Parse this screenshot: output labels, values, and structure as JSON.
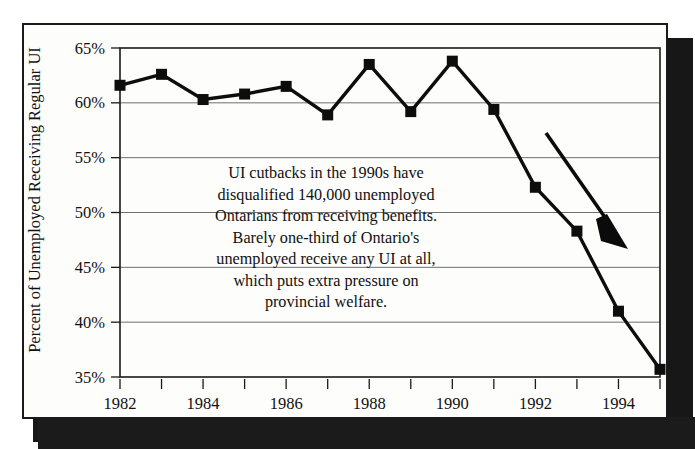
{
  "figure": {
    "cut_off_top_text": "",
    "y_axis_title": "Percent of Unemployed Receiving Regular UI",
    "annotation_lines": [
      "UI cutbacks in the 1990s have",
      "disqualified 140,000 unemployed",
      "Ontarians from receiving benefits.",
      "Barely one-third of Ontario's",
      "unemployed receive any UI at all,",
      "which puts extra pressure on",
      "provincial welfare."
    ],
    "arrow_label": "downward-trend-arrow",
    "colors": {
      "ink": "#0d0d0d",
      "gridline": "#6f6f6f",
      "paper": "#fdfdfb",
      "shadow": "#171717"
    }
  },
  "chart_data": {
    "type": "line",
    "title": "",
    "xlabel": "",
    "ylabel": "Percent of Unemployed Receiving Regular UI",
    "x": [
      1982,
      1983,
      1984,
      1985,
      1986,
      1987,
      1988,
      1989,
      1990,
      1991,
      1992,
      1993,
      1994,
      1995
    ],
    "values": [
      61.6,
      62.6,
      60.3,
      60.8,
      61.5,
      58.9,
      63.5,
      59.2,
      63.8,
      59.4,
      52.3,
      48.3,
      41.0,
      35.7
    ],
    "series": [
      {
        "name": "Percent of unemployed receiving regular UI",
        "values": [
          61.6,
          62.6,
          60.3,
          60.8,
          61.5,
          58.9,
          63.5,
          59.2,
          63.8,
          59.4,
          52.3,
          48.3,
          41.0,
          35.7
        ]
      }
    ],
    "ylim": [
      35,
      65
    ],
    "xlim": [
      1982,
      1995
    ],
    "ytick_values": [
      65,
      60,
      55,
      50,
      45,
      40,
      35
    ],
    "ytick_labels": [
      "65%",
      "60%",
      "55%",
      "50%",
      "45%",
      "40%",
      "35%"
    ],
    "xtick_values": [
      1982,
      1983,
      1984,
      1985,
      1986,
      1987,
      1988,
      1989,
      1990,
      1991,
      1992,
      1993,
      1994,
      1995
    ],
    "xtick_labels": [
      "1982",
      "",
      "1984",
      "",
      "1986",
      "",
      "1988",
      "",
      "1990",
      "",
      "1992",
      "",
      "1994",
      ""
    ],
    "grid": true,
    "legend": "none",
    "marker": "square",
    "annotations": [
      {
        "text": "UI cutbacks in the 1990s have disqualified 140,000 unemployed Ontarians from receiving benefits. Barely one-third of Ontario's unemployed receive any UI at all, which puts extra pressure on provincial welfare.",
        "type": "text-block"
      },
      {
        "text": "",
        "type": "arrow",
        "direction": "down-right"
      }
    ]
  }
}
